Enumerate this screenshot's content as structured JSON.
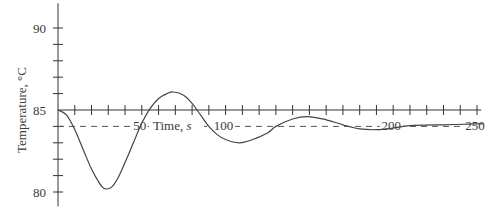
{
  "chart_data": {
    "type": "line",
    "title": "",
    "xlabel": "Time, s",
    "xlabel_parts": {
      "text": "Time, ",
      "unit": "s"
    },
    "ylabel": "Temperature, °C",
    "xlim": [
      0,
      255
    ],
    "ylim": [
      79,
      91.5
    ],
    "x_axis_crosses_y_at": 85,
    "x_ticks": [
      0,
      10,
      20,
      30,
      40,
      50,
      60,
      70,
      80,
      90,
      100,
      110,
      120,
      130,
      140,
      150,
      160,
      170,
      180,
      190,
      200,
      210,
      220,
      230,
      240,
      250
    ],
    "x_tick_labels": [
      {
        "value": 50,
        "label": "50"
      },
      {
        "value": 100,
        "label": "100"
      },
      {
        "value": 200,
        "label": "200"
      },
      {
        "value": 250,
        "label": "250"
      }
    ],
    "y_ticks": [
      80,
      81,
      82,
      83,
      84,
      85,
      86,
      87,
      88,
      89,
      90
    ],
    "y_tick_labels": [
      {
        "value": 80,
        "label": "80"
      },
      {
        "value": 85,
        "label": "85"
      },
      {
        "value": 90,
        "label": "90"
      }
    ],
    "reference_line": {
      "y": 84,
      "style": "dashed",
      "label": "setpoint"
    },
    "grid": false,
    "legend": null,
    "series": [
      {
        "name": "Temperature response",
        "x": [
          0,
          5,
          10,
          15,
          20,
          25,
          28,
          32,
          36,
          40,
          45,
          50,
          55,
          60,
          65,
          69,
          75,
          80,
          85,
          90,
          95,
          100,
          108,
          115,
          125,
          130,
          140,
          149,
          160,
          170,
          180,
          190,
          200,
          210,
          230,
          250,
          254
        ],
        "values": [
          85,
          84.7,
          83.8,
          82.6,
          81.4,
          80.5,
          80.2,
          80.3,
          80.9,
          81.8,
          83.0,
          84.2,
          85.1,
          85.7,
          86.0,
          86.1,
          85.9,
          85.4,
          84.7,
          84.0,
          83.5,
          83.2,
          83.0,
          83.15,
          83.6,
          84.0,
          84.45,
          84.6,
          84.4,
          84.1,
          83.85,
          83.8,
          83.9,
          84.05,
          84.1,
          84.15,
          84.15
        ]
      }
    ]
  }
}
